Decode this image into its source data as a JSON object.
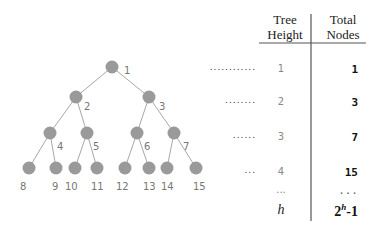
{
  "table": {
    "header_height": "Tree\nHeight",
    "header_height_l1": "Tree",
    "header_height_l2": "Height",
    "header_nodes_l1": "Total",
    "header_nodes_l2": "Nodes",
    "rows": [
      {
        "height": "1",
        "nodes": "1",
        "leader": "............"
      },
      {
        "height": "2",
        "nodes": "3",
        "leader": "........"
      },
      {
        "height": "3",
        "nodes": "7",
        "leader": "......"
      },
      {
        "height": "4",
        "nodes": "15",
        "leader": "..."
      },
      {
        "height": "...",
        "nodes": "..."
      }
    ],
    "general": {
      "height": "h",
      "nodes_base": "2",
      "nodes_exp": "h",
      "nodes_suffix": "-1"
    }
  },
  "tree": {
    "node_color": "#9a9a9a",
    "edge_color": "#a0a0a0",
    "labels": [
      "1",
      "2",
      "3",
      "4",
      "5",
      "6",
      "7",
      "8",
      "9",
      "10",
      "11",
      "12",
      "13",
      "14",
      "15"
    ]
  }
}
